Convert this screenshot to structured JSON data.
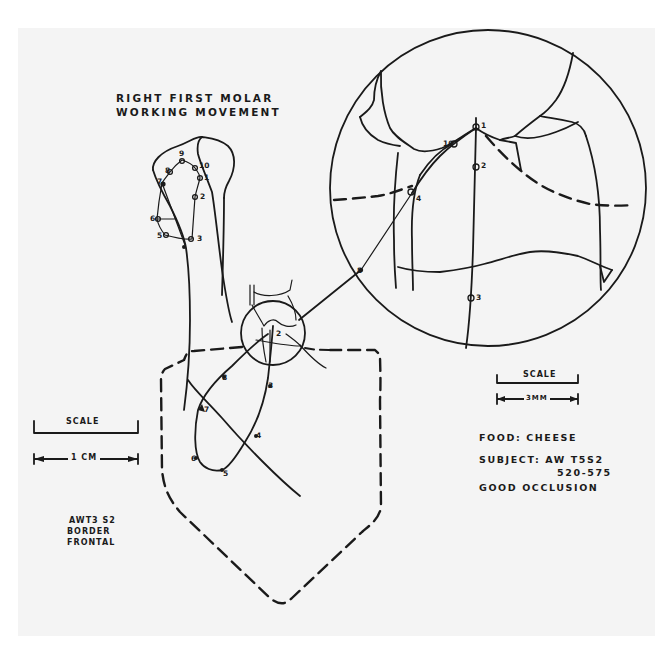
{
  "figure": {
    "title_line1": "RIGHT FIRST MOLAR",
    "title_line2": "WORKING MOVEMENT"
  },
  "scales": {
    "left": {
      "label": "SCALE",
      "unit": "1 CM"
    },
    "right": {
      "label": "SCALE",
      "unit": "3MM"
    }
  },
  "info": {
    "food": "FOOD: CHEESE",
    "subject_line1": "SUBJECT: AW T5S2",
    "subject_line2": "520-575",
    "occlusion": "GOOD OCCLUSION"
  },
  "specimen": {
    "line1": "AWT3 S2",
    "line2": "BORDER",
    "line3": "FRONTAL"
  },
  "point_labels": {
    "upper_trace": [
      "1",
      "2",
      "3",
      "5",
      "6",
      "7",
      "8",
      "9",
      "10"
    ],
    "lower_trace": [
      "2",
      "3",
      "4",
      "5",
      "6",
      "7",
      "8"
    ],
    "magnified_view": [
      "1",
      "2",
      "3",
      "4",
      "8",
      "10"
    ]
  },
  "colors": {
    "ink": "#1a1a1a",
    "paper": "#f4f4f4",
    "margin": "#ffffff"
  }
}
